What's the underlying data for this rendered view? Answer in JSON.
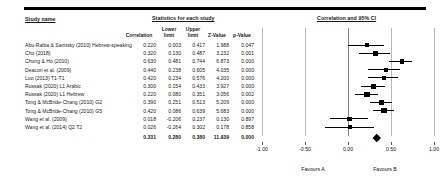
{
  "headers": {
    "study_name": "Study name",
    "statistics": "Statistics for each study",
    "plot": "Correlation and 95% CI"
  },
  "columns": {
    "correlation": "Correlation",
    "lower_limit_1": "Lower",
    "lower_limit_2": "limit",
    "upper_limit_1": "Upper",
    "upper_limit_2": "limit",
    "z_value": "Z-Value",
    "p_value": "p-Value"
  },
  "axis": {
    "ticks": [
      "-1.00",
      "-0.50",
      "0.00",
      "0.50",
      "1.00"
    ],
    "min": -1.0,
    "max": 1.0,
    "favours_left": "Favours A",
    "favours_right": "Favours B"
  },
  "chart_data": {
    "type": "forest",
    "title": "Correlation and 95% CI",
    "xlabel": "",
    "ylabel": "",
    "xlim": [
      -1.0,
      1.0
    ],
    "effect_measure": "Correlation",
    "grid": true,
    "rows": [
      {
        "study": "Abu-Rabia & Sanitsky (2010) Hebrew-speaking",
        "correlation": "0.220",
        "lower": "0.003",
        "upper": "0.417",
        "z": "1.988",
        "p": "0.047",
        "corr_v": 0.22,
        "low_v": 0.003,
        "up_v": 0.417,
        "weight": 0.52
      },
      {
        "study": "Cho (2018)",
        "correlation": "0.320",
        "lower": "0.130",
        "upper": "0.487",
        "z": "3.232",
        "p": "0.001",
        "corr_v": 0.32,
        "low_v": 0.13,
        "up_v": 0.487,
        "weight": 0.58
      },
      {
        "study": "Chung & Ho (2010)",
        "correlation": "0.630",
        "lower": "0.481",
        "upper": "0.744",
        "z": "6.873",
        "p": "0.000",
        "corr_v": 0.63,
        "low_v": 0.481,
        "up_v": 0.744,
        "weight": 0.6
      },
      {
        "study": "Deacon et al. (2009)",
        "correlation": "0.440",
        "lower": "0.238",
        "upper": "0.605",
        "z": "4.035",
        "p": "0.000",
        "corr_v": 0.44,
        "low_v": 0.238,
        "up_v": 0.605,
        "weight": 0.52
      },
      {
        "study": "Luo (2013) T1-T1",
        "correlation": "0.420",
        "lower": "0.234",
        "upper": "0.576",
        "z": "4.200",
        "p": "0.000",
        "corr_v": 0.42,
        "low_v": 0.234,
        "up_v": 0.576,
        "weight": 0.52
      },
      {
        "study": "Russak (2020) L1 Arabic",
        "correlation": "0.300",
        "lower": "0.154",
        "upper": "0.433",
        "z": "3.927",
        "p": "0.000",
        "corr_v": 0.3,
        "low_v": 0.154,
        "up_v": 0.433,
        "weight": 0.72
      },
      {
        "study": "Russak (2020) L1 Hebrew",
        "correlation": "0.220",
        "lower": "0.080",
        "upper": "0.351",
        "z": "3.056",
        "p": "0.002",
        "corr_v": 0.22,
        "low_v": 0.08,
        "up_v": 0.351,
        "weight": 0.84
      },
      {
        "study": "Tong & McBride-Chang (2010) G2",
        "correlation": "0.390",
        "lower": "0.251",
        "upper": "0.513",
        "z": "5.209",
        "p": "0.000",
        "corr_v": 0.39,
        "low_v": 0.251,
        "up_v": 0.513,
        "weight": 0.66
      },
      {
        "study": "Tong & McBride-Chang (2010) G5",
        "correlation": "0.420",
        "lower": "0.086",
        "upper": "0.639",
        "z": "5.683",
        "p": "0.000",
        "corr_v": 0.42,
        "low_v": 0.286,
        "up_v": 0.539,
        "weight": 0.8
      },
      {
        "study": "Wang et al. (2009)",
        "correlation": "0.018",
        "lower": "-0.206",
        "upper": "0.237",
        "z": "0.130",
        "p": "0.897",
        "corr_v": 0.018,
        "low_v": -0.206,
        "up_v": 0.237,
        "weight": 0.46
      },
      {
        "study": "Wang et al. (2014) Q2 T2",
        "correlation": "0.026",
        "lower": "-0.264",
        "upper": "0.302",
        "z": "0.178",
        "p": "0.858",
        "corr_v": 0.026,
        "low_v": -0.264,
        "up_v": 0.302,
        "weight": 0.46
      },
      {
        "study": "",
        "correlation": "0.331",
        "lower": "0.280",
        "upper": "0.380",
        "z": "11.939",
        "p": "0.000",
        "corr_v": 0.331,
        "low_v": 0.28,
        "up_v": 0.38,
        "weight": 0,
        "summary": true
      }
    ]
  }
}
